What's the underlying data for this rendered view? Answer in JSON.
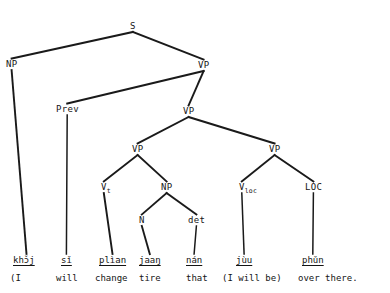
{
  "diagram": {
    "type": "syntax-tree",
    "language_glossed": "Thai",
    "root": "S",
    "nodes": [
      {
        "id": "s",
        "label": "S",
        "sub": "",
        "x": 130,
        "y": 22
      },
      {
        "id": "np-subj",
        "label": "NP",
        "sub": "",
        "x": 6,
        "y": 60
      },
      {
        "id": "vp-1",
        "label": "VP",
        "sub": "",
        "x": 198,
        "y": 61
      },
      {
        "id": "prev",
        "label": "Prev",
        "sub": "",
        "x": 56,
        "y": 105
      },
      {
        "id": "vp-2",
        "label": "VP",
        "sub": "",
        "x": 183,
        "y": 107
      },
      {
        "id": "vp-3",
        "label": "VP",
        "sub": "",
        "x": 132,
        "y": 145
      },
      {
        "id": "vp-4",
        "label": "VP",
        "sub": "",
        "x": 269,
        "y": 145
      },
      {
        "id": "v-t",
        "label": "V",
        "sub": "t",
        "x": 101,
        "y": 183
      },
      {
        "id": "np-obj",
        "label": "NP",
        "sub": "",
        "x": 161,
        "y": 183
      },
      {
        "id": "v-loc",
        "label": "V",
        "sub": "loc",
        "x": 239,
        "y": 183
      },
      {
        "id": "loc",
        "label": "LOC",
        "sub": "",
        "x": 305,
        "y": 183
      },
      {
        "id": "n",
        "label": "N",
        "sub": "",
        "x": 139,
        "y": 216
      },
      {
        "id": "det",
        "label": "det",
        "sub": "",
        "x": 188,
        "y": 216
      }
    ],
    "edges": [
      {
        "from": "s",
        "to": "np-subj"
      },
      {
        "from": "s",
        "to": "vp-1"
      },
      {
        "from": "vp-1",
        "to": "prev"
      },
      {
        "from": "vp-1",
        "to": "vp-2"
      },
      {
        "from": "vp-2",
        "to": "vp-3"
      },
      {
        "from": "vp-2",
        "to": "vp-4"
      },
      {
        "from": "vp-3",
        "to": "v-t"
      },
      {
        "from": "vp-3",
        "to": "np-obj"
      },
      {
        "from": "vp-4",
        "to": "v-loc"
      },
      {
        "from": "vp-4",
        "to": "loc"
      },
      {
        "from": "np-obj",
        "to": "n"
      },
      {
        "from": "np-obj",
        "to": "det"
      },
      {
        "from": "np-subj",
        "to": "t-1"
      },
      {
        "from": "prev",
        "to": "t-2"
      },
      {
        "from": "v-t",
        "to": "t-3"
      },
      {
        "from": "n",
        "to": "t-4"
      },
      {
        "from": "det",
        "to": "t-5"
      },
      {
        "from": "v-loc",
        "to": "t-6"
      },
      {
        "from": "loc",
        "to": "t-7"
      }
    ],
    "terminals": [
      {
        "id": "t-1",
        "word": "khɔ̌j",
        "gloss": "(I",
        "x": 13,
        "y": 256,
        "gloss_x": 10,
        "gloss_y": 274
      },
      {
        "id": "t-2",
        "word": "sǐ",
        "gloss": "will",
        "x": 61,
        "y": 256,
        "gloss_x": 56,
        "gloss_y": 274
      },
      {
        "id": "t-3",
        "word": "plìan",
        "gloss": "change",
        "x": 99,
        "y": 256,
        "gloss_x": 95,
        "gloss_y": 274
      },
      {
        "id": "t-4",
        "word": "jaaŋ",
        "gloss": "tire",
        "x": 139,
        "y": 256,
        "gloss_x": 139,
        "gloss_y": 274
      },
      {
        "id": "t-5",
        "word": "nán",
        "gloss": "that",
        "x": 186,
        "y": 256,
        "gloss_x": 186,
        "gloss_y": 274
      },
      {
        "id": "t-6",
        "word": "jùu",
        "gloss": "(I will be)",
        "x": 236,
        "y": 256,
        "gloss_x": 222,
        "gloss_y": 274
      },
      {
        "id": "t-7",
        "word": "phǔn",
        "gloss": "over there.",
        "x": 302,
        "y": 256,
        "gloss_x": 298,
        "gloss_y": 274
      }
    ]
  }
}
